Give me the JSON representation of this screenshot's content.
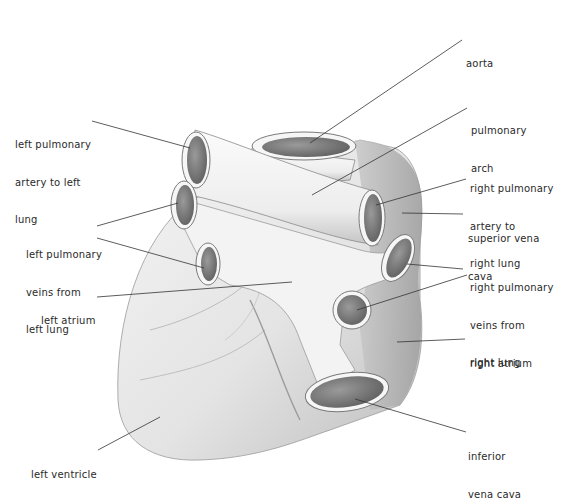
{
  "diagram": {
    "type": "anatomical-illustration",
    "style": "pencil shading",
    "colors": {
      "background": "#ffffff",
      "text": "#2a2a2a",
      "leader": "#333333",
      "shade_dark": "#7a7a7a",
      "shade_mid": "#b8b8b8",
      "shade_light": "#e6e6e6"
    }
  },
  "labels": {
    "aorta": {
      "lines": [
        "aorta"
      ]
    },
    "pulmonary_arch": {
      "lines": [
        "pulmonary",
        "arch"
      ]
    },
    "left_pulmonary_artery": {
      "lines": [
        "left pulmonary",
        "artery to left",
        "lung"
      ]
    },
    "right_pulmonary_artery": {
      "lines": [
        "right pulmonary",
        "artery to",
        "right lung"
      ]
    },
    "superior_vena_cava": {
      "lines": [
        "superior vena",
        "cava"
      ]
    },
    "left_pulmonary_veins": {
      "lines": [
        "left pulmonary",
        "veins from",
        "left lung"
      ]
    },
    "right_pulmonary_veins": {
      "lines": [
        "right pulmonary",
        "veins from",
        "right lung"
      ]
    },
    "left_atrium": {
      "lines": [
        "left atrium"
      ]
    },
    "right_atrium": {
      "lines": [
        "right atrium"
      ]
    },
    "left_ventricle": {
      "lines": [
        "left ventricle"
      ]
    },
    "inferior_vena_cava": {
      "lines": [
        "inferior",
        "vena cava"
      ]
    }
  }
}
